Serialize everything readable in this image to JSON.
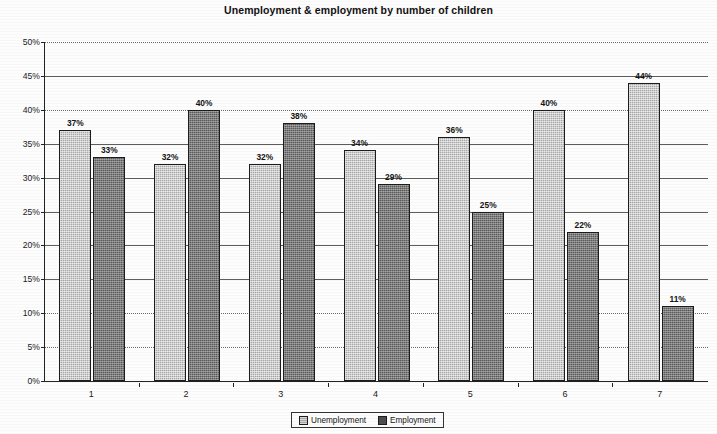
{
  "chart_data": {
    "type": "bar",
    "title": "Unemployment & employment by number of children",
    "xlabel": "",
    "ylabel": "",
    "categories": [
      "1",
      "2",
      "3",
      "4",
      "5",
      "6",
      "7"
    ],
    "series": [
      {
        "name": "Unemployment",
        "values": [
          37,
          32,
          32,
          34,
          36,
          40,
          44
        ],
        "labels": [
          "37%",
          "32%",
          "32%",
          "34%",
          "36%",
          "40%",
          "44%"
        ],
        "color": "#a8a8a8"
      },
      {
        "name": "Employment",
        "values": [
          33,
          40,
          38,
          29,
          25,
          22,
          11
        ],
        "labels": [
          "33%",
          "40%",
          "38%",
          "29%",
          "25%",
          "22%",
          "11%"
        ],
        "color": "#5a5a5a"
      }
    ],
    "ylim": [
      0,
      50
    ],
    "ytick_labels": [
      "0%",
      "5%",
      "10%",
      "15%",
      "20%",
      "25%",
      "30%",
      "35%",
      "40%",
      "45%",
      "50%"
    ],
    "ytick_values": [
      0,
      5,
      10,
      15,
      20,
      25,
      30,
      35,
      40,
      45,
      50
    ],
    "grid": true,
    "legend_position": "bottom"
  },
  "legend": {
    "entries": [
      {
        "label": "Unemployment"
      },
      {
        "label": "Employment"
      }
    ]
  }
}
